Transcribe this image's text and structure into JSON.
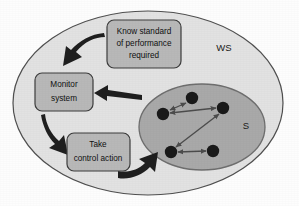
{
  "diagram": {
    "background_color": "#fdfdfd",
    "regions": [
      {
        "id": "work-system",
        "label": "WS",
        "shape": "ellipse",
        "fill_color": "#e2e2e2",
        "stroke_color": "#4a4a4a",
        "cx": 148,
        "cy": 103,
        "rx": 135,
        "ry": 92,
        "label_x": 224,
        "label_y": 48
      },
      {
        "id": "system",
        "label": "S",
        "shape": "ellipse",
        "fill_color": "#a9a9a9",
        "stroke_color": "#6a6a6a",
        "cx": 202,
        "cy": 127,
        "rx": 63,
        "ry": 43,
        "label_x": 246,
        "label_y": 126
      }
    ],
    "boxes": [
      {
        "id": "know-standard",
        "lines": [
          "Know standard",
          "of performance",
          "required"
        ],
        "x": 107,
        "y": 20,
        "width": 74,
        "height": 48,
        "fill_color": "#b8b8b8",
        "stroke_color": "#3c3c3c",
        "corner_radius": 7
      },
      {
        "id": "monitor-system",
        "lines": [
          "Monitor",
          "system"
        ],
        "x": 35,
        "y": 73,
        "width": 58,
        "height": 38,
        "fill_color": "#b8b8b8",
        "stroke_color": "#3c3c3c",
        "corner_radius": 7
      },
      {
        "id": "take-control-action",
        "lines": [
          "Take",
          "control action"
        ],
        "x": 67,
        "y": 133,
        "width": 63,
        "height": 38,
        "fill_color": "#b8b8b8",
        "stroke_color": "#3c3c3c",
        "corner_radius": 7
      }
    ],
    "flow_arrows": [
      {
        "id": "standard-to-monitor",
        "from": "know-standard",
        "to": "monitor-system",
        "style": "thick-curved",
        "color": "#1f1f1f"
      },
      {
        "id": "monitor-to-control",
        "from": "monitor-system",
        "to": "take-control-action",
        "style": "thick-curved",
        "color": "#1f1f1f"
      },
      {
        "id": "control-to-system",
        "from": "take-control-action",
        "to": "system",
        "style": "thick-curved",
        "color": "#1f1f1f"
      },
      {
        "id": "system-to-monitor",
        "from": "system",
        "to": "monitor-system",
        "style": "thick-straight",
        "color": "#1f1f1f"
      }
    ],
    "system_nodes": [
      {
        "id": "node-top",
        "cx": 192,
        "cy": 98,
        "r": 6.2,
        "fill_color": "#1a1a1a"
      },
      {
        "id": "node-left",
        "cx": 163,
        "cy": 114,
        "r": 6.2,
        "fill_color": "#1a1a1a"
      },
      {
        "id": "node-right",
        "cx": 223,
        "cy": 108,
        "r": 6.2,
        "fill_color": "#1a1a1a"
      },
      {
        "id": "node-bottom-left",
        "cx": 171,
        "cy": 152,
        "r": 6.2,
        "fill_color": "#1a1a1a"
      },
      {
        "id": "node-bottom-right",
        "cx": 213,
        "cy": 151,
        "r": 6.2,
        "fill_color": "#1a1a1a"
      }
    ],
    "system_links": [
      {
        "id": "link-top-left",
        "from": "node-top",
        "to": "node-left",
        "arrowheads": "both",
        "color": "#4c4c4c"
      },
      {
        "id": "link-left-right",
        "from": "node-left",
        "to": "node-right",
        "arrowheads": "both",
        "color": "#4c4c4c"
      },
      {
        "id": "link-right-bottomleft",
        "from": "node-right",
        "to": "node-bottom-left",
        "arrowheads": "both",
        "color": "#4c4c4c"
      },
      {
        "id": "link-bottomleft-bottomright",
        "from": "node-bottom-left",
        "to": "node-bottom-right",
        "arrowheads": "both",
        "color": "#4c4c4c"
      }
    ]
  }
}
